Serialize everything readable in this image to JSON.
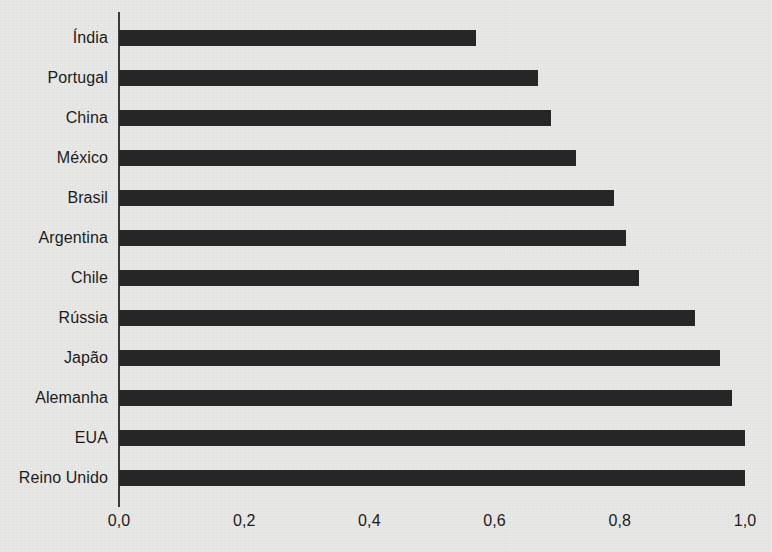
{
  "chart_data": {
    "type": "bar",
    "orientation": "horizontal",
    "title": "",
    "subtitle": "",
    "xlabel": "",
    "ylabel": "",
    "xlim": [
      0.0,
      1.0
    ],
    "xticks": [
      0.0,
      0.2,
      0.4,
      0.6,
      0.8,
      1.0
    ],
    "xtick_labels": [
      "0,0",
      "0,2",
      "0,4",
      "0,6",
      "0,8",
      "1,0"
    ],
    "grid": false,
    "legend": false,
    "legend_position": "none",
    "bar_color": "#262626",
    "background_color": "#e9e9e7",
    "axis_color": "#3a3a3a",
    "categories": [
      "Índia",
      "Portugal",
      "China",
      "México",
      "Brasil",
      "Argentina",
      "Chile",
      "Rússia",
      "Japão",
      "Alemanha",
      "EUA",
      "Reino Unido"
    ],
    "values": [
      0.57,
      0.67,
      0.69,
      0.73,
      0.79,
      0.81,
      0.83,
      0.92,
      0.96,
      0.98,
      1.0,
      1.0
    ]
  }
}
